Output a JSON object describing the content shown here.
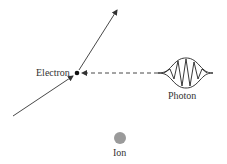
{
  "diagram": {
    "labels": {
      "electron": "Electron",
      "photon": "Photon",
      "ion": "Ion"
    },
    "colors": {
      "line": "#333333",
      "ion": "#9a9a9a",
      "electron": "#111111"
    }
  }
}
